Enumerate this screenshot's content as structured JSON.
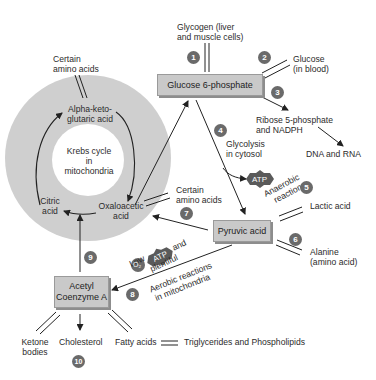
{
  "krebs": {
    "center_line1": "Krebs cycle",
    "center_line2": "in",
    "center_line3": "mitochondria",
    "alpha_line1": "Alpha-keto-",
    "alpha_line2": "glutaric acid",
    "citric_line1": "Citric",
    "citric_line2": "acid",
    "oxalo_line1": "Oxaloacetic",
    "oxalo_line2": "acid",
    "ring_color": "#cfcfcf"
  },
  "nodes": {
    "g6p": "Glucose 6-phosphate",
    "pyruvic": "Pyruvic acid",
    "acetyl_line1": "Acetyl",
    "acetyl_line2": "Coenzyme A",
    "box_color": "#c9c9c9"
  },
  "labels": {
    "glycogen_line1": "Glycogen (liver",
    "glycogen_line2": "and muscle cells)",
    "glucose_line1": "Glucose",
    "glucose_line2": "(in blood)",
    "ribose_line1": "Ribose 5-phosphate",
    "ribose_line2": "and NADPH",
    "dna_rna": "DNA and RNA",
    "glycolysis_line1": "Glycolysis",
    "glycolysis_line2": "in cytosol",
    "atp": "ATP",
    "anaerobic_line1": "Anaerobic",
    "anaerobic_line2": "reactions",
    "lactic": "Lactic acid",
    "alanine_line1": "Alanine",
    "alanine_line2": "(amino acid)",
    "amino_top_line1": "Certain",
    "amino_top_line2": "amino acids",
    "amino_mid_line1": "Certain",
    "amino_mid_line2": "amino acids",
    "low": "Low",
    "and": "and",
    "o2": "O₂",
    "plentiful": "plentiful",
    "aerobic_line1": "Aerobic reactions",
    "aerobic_line2": "in mitochondria",
    "ketone_line1": "Ketone",
    "ketone_line2": "bodies",
    "cholesterol": "Cholesterol",
    "fatty": "Fatty acids",
    "trig": "Triglycerides and Phospholipids"
  },
  "steps": [
    "1",
    "2",
    "3",
    "4",
    "5",
    "6",
    "7",
    "8",
    "9",
    "10"
  ]
}
